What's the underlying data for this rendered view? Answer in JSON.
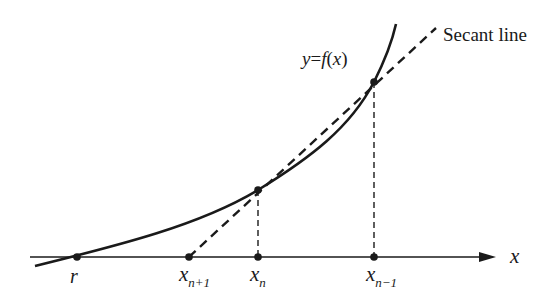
{
  "diagram": {
    "curve_label": {
      "y": "y",
      "eq": "=",
      "f": "f",
      "open": "(",
      "x": "x",
      "close": ")"
    },
    "secant_label": "Secant line",
    "axis_label": "x",
    "points": [
      {
        "name": "r",
        "base": "r",
        "sub": ""
      },
      {
        "name": "x_n+1",
        "base": "x",
        "sub": "n+1"
      },
      {
        "name": "x_n",
        "base": "x",
        "sub": "n"
      },
      {
        "name": "x_n-1",
        "base": "x",
        "sub": "n−1"
      }
    ],
    "colors": {
      "ink": "#1a1a1a",
      "background": "#ffffff"
    }
  }
}
